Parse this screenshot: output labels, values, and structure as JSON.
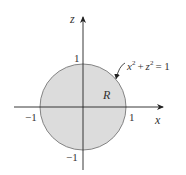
{
  "diagram": {
    "type": "region-plot",
    "axes": {
      "horizontal_label": "x",
      "vertical_label": "z"
    },
    "ticks": {
      "x_pos": "1",
      "x_neg": "−1",
      "z_pos": "1",
      "z_neg": "−1"
    },
    "region": {
      "label": "R",
      "fill": "#dcdcdc",
      "stroke": "#777777"
    },
    "curve": {
      "equation_x": "x",
      "equation_z": "z",
      "sup": "2",
      "plus": "+",
      "equals": "= 1"
    }
  }
}
